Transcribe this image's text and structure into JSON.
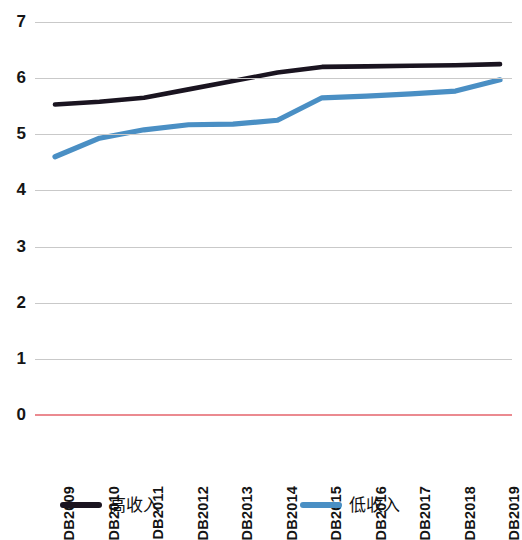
{
  "chart_data": {
    "type": "line",
    "title": "",
    "subtitle": "",
    "xlabel": "",
    "ylabel": "",
    "categories": [
      "DB2009",
      "DB2010",
      "DB2011",
      "DB2012",
      "DB2013",
      "DB2014",
      "DB2015",
      "DB2016",
      "DB2017",
      "DB2018",
      "DB2019"
    ],
    "series": [
      {
        "name": "高收入",
        "color": "#1a1420",
        "values": [
          5.53,
          5.58,
          5.65,
          5.8,
          5.95,
          6.1,
          6.2,
          6.21,
          6.22,
          6.23,
          6.25
        ]
      },
      {
        "name": "低收入",
        "color": "#4a8fc4",
        "values": [
          4.6,
          4.93,
          5.08,
          5.17,
          5.18,
          5.25,
          5.65,
          5.68,
          5.72,
          5.77,
          5.97
        ]
      }
    ],
    "ylim": [
      0,
      7
    ],
    "yticks": [
      0,
      1,
      2,
      3,
      4,
      5,
      6,
      7
    ],
    "ytick_labels": [
      "0",
      "1",
      "2",
      "3",
      "4",
      "5",
      "6",
      "7"
    ],
    "grid": true,
    "grid_color": "#c9c9c9",
    "axis_baseline_color": "#eb8a90",
    "legend_position": "bottom"
  }
}
